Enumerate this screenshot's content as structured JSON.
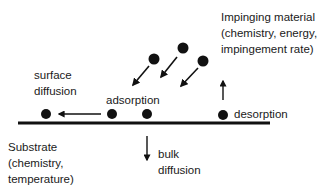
{
  "labels": {
    "impinging": "Impinging material\n(chemistry, energy,\nimpingement rate)",
    "surface_diffusion": "surface\ndiffusion",
    "adsorption": "adsorption",
    "desorption": "desorption",
    "substrate": "Substrate\n(chemistry,\ntemperature)",
    "bulk_diffusion": "bulk\ndiffusion"
  },
  "colors": {
    "ink": "#111111",
    "background": "#ffffff"
  }
}
